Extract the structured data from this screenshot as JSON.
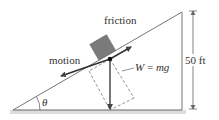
{
  "labels": {
    "friction": "friction",
    "motion": "motion",
    "weight_lhs": "W",
    "weight_eq": " = ",
    "weight_rhs": "mg",
    "height": "50 ft",
    "angle": "θ"
  },
  "colors": {
    "line": "#555555",
    "block": "#7a7a7a",
    "arrow": "#555555",
    "ground": "#d9d9d9"
  }
}
